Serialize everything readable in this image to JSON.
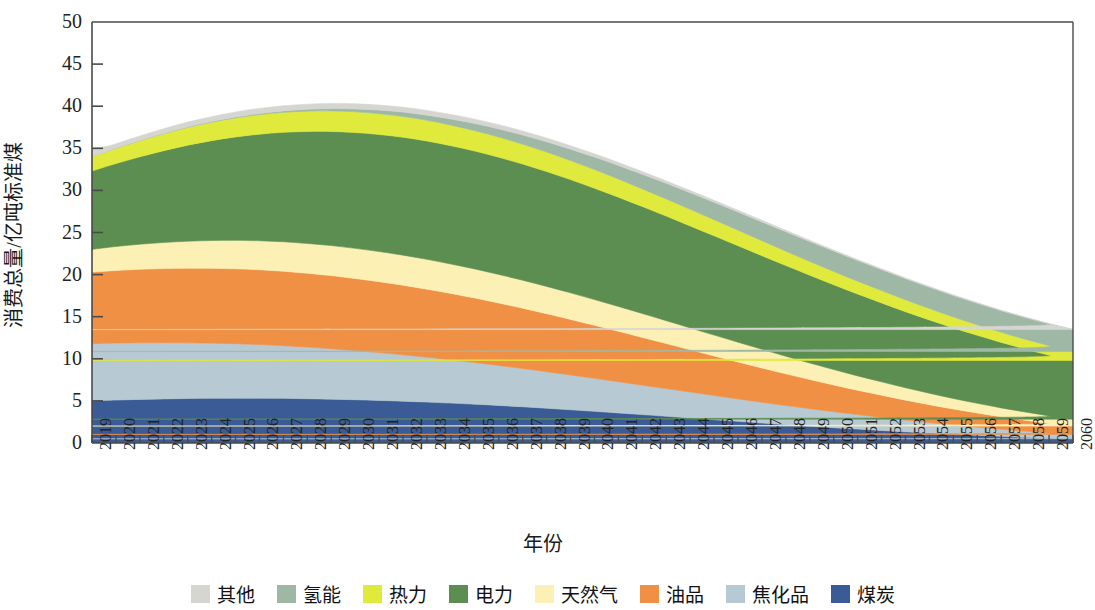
{
  "chart_data": {
    "type": "area",
    "stacked": true,
    "title": "",
    "xlabel": "年份",
    "ylabel": "消费总量/亿吨标准煤",
    "ylim": [
      0,
      50
    ],
    "ytick_values": [
      0,
      5,
      10,
      15,
      20,
      25,
      30,
      35,
      40,
      45,
      50
    ],
    "ytick_labels": [
      "0",
      "5",
      "10",
      "15",
      "20",
      "25",
      "30",
      "35",
      "40",
      "45",
      "50"
    ],
    "grid": false,
    "legend_position": "bottom",
    "categories": [
      "2019",
      "2020",
      "2021",
      "2022",
      "2023",
      "2024",
      "2025",
      "2026",
      "2027",
      "2028",
      "2029",
      "2030",
      "2031",
      "2032",
      "2033",
      "2034",
      "2035",
      "2036",
      "2037",
      "2038",
      "2039",
      "2040",
      "2041",
      "2042",
      "2043",
      "2044",
      "2045",
      "2046",
      "2047",
      "2048",
      "2049",
      "2050",
      "2051",
      "2052",
      "2053",
      "2054",
      "2055",
      "2056",
      "2057",
      "2058",
      "2059",
      "2060"
    ],
    "stack_order_bottom_to_top": [
      "煤炭",
      "焦化品",
      "油品",
      "天然气",
      "电力",
      "热力",
      "氢能",
      "其他"
    ],
    "series": [
      {
        "name": "煤炭",
        "color": "#3a5b96",
        "values": [
          5.0,
          5.1,
          5.18,
          5.24,
          5.28,
          5.31,
          5.32,
          5.32,
          5.3,
          5.26,
          5.21,
          5.14,
          5.06,
          4.97,
          4.86,
          4.74,
          4.61,
          4.46,
          4.3,
          4.13,
          3.95,
          3.76,
          3.57,
          3.37,
          3.17,
          2.97,
          2.77,
          2.57,
          2.37,
          2.18,
          2.0,
          1.82,
          1.65,
          1.49,
          1.33,
          1.18,
          1.04,
          0.91,
          0.79,
          0.68,
          0.58,
          0.5
        ]
      },
      {
        "name": "焦化品",
        "color": "#b7c9d3",
        "values": [
          6.8,
          6.77,
          6.73,
          6.68,
          6.62,
          6.55,
          6.47,
          6.37,
          6.26,
          6.13,
          5.99,
          5.84,
          5.68,
          5.51,
          5.33,
          5.14,
          4.95,
          4.75,
          4.55,
          4.34,
          4.13,
          3.92,
          3.71,
          3.5,
          3.29,
          3.08,
          2.87,
          2.67,
          2.47,
          2.27,
          2.08,
          1.9,
          1.72,
          1.55,
          1.39,
          1.24,
          1.09,
          0.96,
          0.83,
          0.72,
          0.61,
          0.52
        ]
      },
      {
        "name": "油品",
        "color": "#ef9045",
        "values": [
          8.5,
          8.62,
          8.72,
          8.8,
          8.86,
          8.89,
          8.9,
          8.88,
          8.84,
          8.77,
          8.68,
          8.56,
          8.42,
          8.26,
          8.08,
          7.88,
          7.66,
          7.42,
          7.16,
          6.89,
          6.6,
          6.3,
          5.99,
          5.67,
          5.35,
          5.02,
          4.7,
          4.38,
          4.07,
          3.76,
          3.46,
          3.17,
          2.89,
          2.63,
          2.37,
          2.13,
          1.9,
          1.69,
          1.49,
          1.31,
          1.14,
          0.99
        ]
      },
      {
        "name": "天然气",
        "color": "#fdf0b5",
        "values": [
          2.7,
          2.85,
          2.98,
          3.1,
          3.21,
          3.3,
          3.38,
          3.45,
          3.5,
          3.54,
          3.57,
          3.58,
          3.58,
          3.57,
          3.54,
          3.5,
          3.45,
          3.39,
          3.32,
          3.24,
          3.15,
          3.05,
          2.95,
          2.84,
          2.72,
          2.6,
          2.48,
          2.35,
          2.22,
          2.09,
          1.96,
          1.83,
          1.71,
          1.59,
          1.47,
          1.36,
          1.25,
          1.15,
          1.06,
          0.97,
          0.89,
          0.82
        ]
      },
      {
        "name": "电力",
        "color": "#5c8e51",
        "values": [
          9.3,
          9.85,
          10.38,
          10.9,
          11.4,
          11.86,
          12.28,
          12.66,
          13.0,
          13.3,
          13.55,
          13.75,
          13.9,
          14.0,
          14.05,
          14.05,
          14.0,
          13.92,
          13.8,
          13.64,
          13.45,
          13.23,
          12.98,
          12.71,
          12.42,
          12.11,
          11.79,
          11.46,
          11.12,
          10.77,
          10.42,
          10.07,
          9.72,
          9.38,
          9.04,
          8.71,
          8.39,
          8.08,
          7.78,
          7.49,
          7.22,
          6.96
        ]
      },
      {
        "name": "热力",
        "color": "#e0ea3d",
        "values": [
          1.72,
          1.82,
          1.92,
          2.02,
          2.11,
          2.19,
          2.26,
          2.32,
          2.37,
          2.41,
          2.44,
          2.46,
          2.47,
          2.47,
          2.46,
          2.44,
          2.42,
          2.39,
          2.35,
          2.31,
          2.26,
          2.21,
          2.15,
          2.09,
          2.03,
          1.97,
          1.9,
          1.84,
          1.77,
          1.71,
          1.64,
          1.58,
          1.52,
          1.46,
          1.4,
          1.34,
          1.29,
          1.24,
          1.19,
          1.15,
          1.11,
          1.07
        ]
      },
      {
        "name": "氢能",
        "color": "#9fb8a6",
        "values": [
          0.0,
          0.01,
          0.02,
          0.03,
          0.05,
          0.07,
          0.1,
          0.13,
          0.17,
          0.22,
          0.28,
          0.35,
          0.43,
          0.52,
          0.62,
          0.73,
          0.85,
          0.97,
          1.1,
          1.23,
          1.36,
          1.49,
          1.62,
          1.74,
          1.86,
          1.97,
          2.07,
          2.16,
          2.24,
          2.31,
          2.37,
          2.42,
          2.46,
          2.49,
          2.52,
          2.54,
          2.56,
          2.57,
          2.58,
          2.59,
          2.6,
          2.61
        ]
      },
      {
        "name": "其他",
        "color": "#d5d5d2",
        "values": [
          0.5,
          0.52,
          0.54,
          0.56,
          0.58,
          0.59,
          0.6,
          0.61,
          0.61,
          0.61,
          0.61,
          0.6,
          0.59,
          0.58,
          0.56,
          0.54,
          0.52,
          0.5,
          0.47,
          0.44,
          0.41,
          0.38,
          0.35,
          0.32,
          0.29,
          0.26,
          0.24,
          0.21,
          0.19,
          0.17,
          0.15,
          0.13,
          0.11,
          0.1,
          0.09,
          0.08,
          0.07,
          0.06,
          0.05,
          0.04,
          0.04,
          0.03
        ]
      }
    ],
    "totals": [
      34.52,
      35.54,
      36.47,
      37.33,
      38.11,
      38.76,
      39.31,
      39.74,
      40.05,
      40.24,
      40.33,
      40.28,
      40.13,
      39.88,
      39.5,
      39.02,
      38.46,
      37.81,
      37.05,
      36.22,
      35.31,
      34.34,
      33.32,
      32.24,
      31.13,
      29.98,
      28.82,
      27.64,
      26.45,
      25.26,
      24.08,
      22.92,
      21.78,
      20.69,
      19.61,
      18.58,
      17.59,
      16.66,
      15.77,
      14.95,
      14.19,
      13.5
    ]
  },
  "axis": {
    "ylabel": "消费总量/亿吨标准煤",
    "xlabel": "年份"
  },
  "legend": {
    "items": [
      {
        "label": "其他",
        "color": "#d5d5d2"
      },
      {
        "label": "氢能",
        "color": "#9fb8a6"
      },
      {
        "label": "热力",
        "color": "#e0ea3d"
      },
      {
        "label": "电力",
        "color": "#5c8e51"
      },
      {
        "label": "天然气",
        "color": "#fdf0b5"
      },
      {
        "label": "油品",
        "color": "#ef9045"
      },
      {
        "label": "焦化品",
        "color": "#b7c9d3"
      },
      {
        "label": "煤炭",
        "color": "#3a5b96"
      }
    ]
  }
}
